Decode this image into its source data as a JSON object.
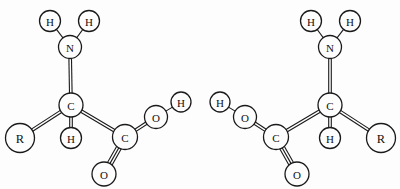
{
  "figure": {
    "background_color": "#fdfdfd",
    "stroke_color": "#1a1a1a",
    "width": 400,
    "height": 189
  },
  "molecules": [
    {
      "id": "left-enantiomer",
      "name": "L-amino-acid",
      "atoms": [
        {
          "id": "l-h-amine-left",
          "label": "H",
          "cx": 50,
          "cy": 21,
          "r": 10.5,
          "size": "normal"
        },
        {
          "id": "l-h-amine-right",
          "label": "H",
          "cx": 89,
          "cy": 21,
          "r": 10.5,
          "size": "normal"
        },
        {
          "id": "l-n",
          "label": "N",
          "cx": 70,
          "cy": 47,
          "r": 11.5,
          "size": "normal"
        },
        {
          "id": "l-c-alpha",
          "label": "C",
          "cx": 71,
          "cy": 105,
          "r": 12.0,
          "size": "normal"
        },
        {
          "id": "l-h-alpha",
          "label": "H",
          "cx": 71,
          "cy": 138,
          "r": 10.5,
          "size": "normal"
        },
        {
          "id": "l-r",
          "label": "R",
          "cx": 20,
          "cy": 138,
          "r": 14.5,
          "size": "big"
        },
        {
          "id": "l-c-carboxyl",
          "label": "C",
          "cx": 125,
          "cy": 137,
          "r": 12.5,
          "size": "normal"
        },
        {
          "id": "l-o-hydroxyl",
          "label": "O",
          "cx": 156,
          "cy": 117,
          "r": 11.5,
          "size": "normal"
        },
        {
          "id": "l-h-hydroxyl",
          "label": "H",
          "cx": 181,
          "cy": 102,
          "r": 10.0,
          "size": "normal"
        },
        {
          "id": "l-o-carbonyl",
          "label": "O",
          "cx": 104,
          "cy": 174,
          "r": 12.0,
          "size": "normal"
        }
      ],
      "bonds": [
        {
          "id": "l-bond-n-h-left",
          "from": "l-n",
          "to": "l-h-amine-left",
          "order": 1
        },
        {
          "id": "l-bond-n-h-right",
          "from": "l-n",
          "to": "l-h-amine-right",
          "order": 1
        },
        {
          "id": "l-bond-n-c",
          "from": "l-n",
          "to": "l-c-alpha",
          "order": 2
        },
        {
          "id": "l-bond-c-h",
          "from": "l-c-alpha",
          "to": "l-h-alpha",
          "order": 2
        },
        {
          "id": "l-bond-c-r",
          "from": "l-c-alpha",
          "to": "l-r",
          "order": 2
        },
        {
          "id": "l-bond-c-c",
          "from": "l-c-alpha",
          "to": "l-c-carboxyl",
          "order": 2
        },
        {
          "id": "l-bond-c-o-single",
          "from": "l-c-carboxyl",
          "to": "l-o-hydroxyl",
          "order": 2
        },
        {
          "id": "l-bond-o-h",
          "from": "l-o-hydroxyl",
          "to": "l-h-hydroxyl",
          "order": 1
        },
        {
          "id": "l-bond-c-o-double",
          "from": "l-c-carboxyl",
          "to": "l-o-carbonyl",
          "order": 3
        }
      ]
    },
    {
      "id": "right-enantiomer",
      "name": "D-amino-acid",
      "atoms": [
        {
          "id": "r-h-amine-left",
          "label": "H",
          "cx": 311,
          "cy": 21,
          "r": 10.5,
          "size": "normal"
        },
        {
          "id": "r-h-amine-right",
          "label": "H",
          "cx": 350,
          "cy": 21,
          "r": 10.5,
          "size": "normal"
        },
        {
          "id": "r-n",
          "label": "N",
          "cx": 330,
          "cy": 47,
          "r": 11.5,
          "size": "normal"
        },
        {
          "id": "r-c-alpha",
          "label": "C",
          "cx": 330,
          "cy": 105,
          "r": 12.0,
          "size": "normal"
        },
        {
          "id": "r-h-alpha",
          "label": "H",
          "cx": 330,
          "cy": 138,
          "r": 10.5,
          "size": "normal"
        },
        {
          "id": "r-r",
          "label": "R",
          "cx": 381,
          "cy": 138,
          "r": 14.5,
          "size": "big"
        },
        {
          "id": "r-c-carboxyl",
          "label": "C",
          "cx": 276,
          "cy": 137,
          "r": 12.5,
          "size": "normal"
        },
        {
          "id": "r-o-hydroxyl",
          "label": "O",
          "cx": 245,
          "cy": 117,
          "r": 11.5,
          "size": "normal"
        },
        {
          "id": "r-h-hydroxyl",
          "label": "H",
          "cx": 220,
          "cy": 102,
          "r": 10.0,
          "size": "normal"
        },
        {
          "id": "r-o-carbonyl",
          "label": "O",
          "cx": 297,
          "cy": 174,
          "r": 12.0,
          "size": "normal"
        }
      ],
      "bonds": [
        {
          "id": "r-bond-n-h-left",
          "from": "r-n",
          "to": "r-h-amine-left",
          "order": 1
        },
        {
          "id": "r-bond-n-h-right",
          "from": "r-n",
          "to": "r-h-amine-right",
          "order": 1
        },
        {
          "id": "r-bond-n-c",
          "from": "r-n",
          "to": "r-c-alpha",
          "order": 2
        },
        {
          "id": "r-bond-c-h",
          "from": "r-c-alpha",
          "to": "r-h-alpha",
          "order": 2
        },
        {
          "id": "r-bond-c-r",
          "from": "r-c-alpha",
          "to": "r-r",
          "order": 2
        },
        {
          "id": "r-bond-c-c",
          "from": "r-c-alpha",
          "to": "r-c-carboxyl",
          "order": 2
        },
        {
          "id": "r-bond-c-o-single",
          "from": "r-c-carboxyl",
          "to": "r-o-hydroxyl",
          "order": 2
        },
        {
          "id": "r-bond-o-h",
          "from": "r-o-hydroxyl",
          "to": "r-h-hydroxyl",
          "order": 1
        },
        {
          "id": "r-bond-c-o-double",
          "from": "r-c-carboxyl",
          "to": "r-o-carbonyl",
          "order": 3
        }
      ]
    }
  ]
}
